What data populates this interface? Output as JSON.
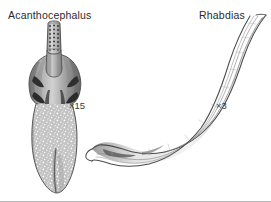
{
  "figure": {
    "background_color": "#ffffff",
    "ink_color": "#3b3b3b",
    "border_color": "#b9b9b9",
    "specimens": [
      {
        "id": "acanthocephalus",
        "name": "Acanthocephalus",
        "magnification": "×15",
        "common_group": "acanthocephalan (thorny-headed worm)",
        "features": [
          "proboscis-with-hooks",
          "neck",
          "bulbous-anterior-trunk",
          "stippled-trunk-surface",
          "tapered-posterior-end"
        ]
      },
      {
        "id": "rhabdias",
        "name": "Rhabdias",
        "magnification": "×3",
        "common_group": "nematode (lung fluke-worm)",
        "features": [
          "sinuous-s-curved-body",
          "longitudinal-internal-lines",
          "blunt-anterior-end",
          "tapered-pointed-tail"
        ]
      }
    ]
  }
}
